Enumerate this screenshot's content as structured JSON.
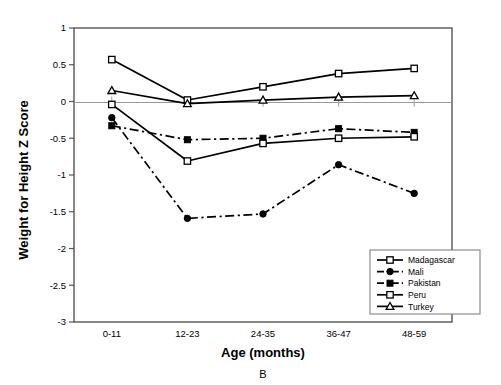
{
  "chart_data": {
    "type": "line",
    "title": "",
    "panel_letter": "B",
    "xlabel": "Age (months)",
    "ylabel": "Weight for Height Z Score",
    "categories": [
      "0-11",
      "12-23",
      "24-35",
      "36-47",
      "48-59"
    ],
    "ylim": [
      -3,
      1
    ],
    "yticks": [
      1,
      0.5,
      0,
      -0.5,
      -1,
      -1.5,
      -2,
      -2.5,
      -3
    ],
    "ytick_labels": [
      "1",
      "0.5",
      "0",
      "-0.5",
      "-1",
      "-1.5",
      "-2",
      "-2.5",
      "-3"
    ],
    "grid": false,
    "zero_line": true,
    "legend_position": "bottom-right",
    "series": [
      {
        "name": "Madagascar",
        "marker": "open-square",
        "line_style": "solid",
        "values": [
          0.57,
          0.02,
          0.2,
          0.38,
          0.45
        ]
      },
      {
        "name": "Mali",
        "marker": "filled-circle",
        "line_style": "dash-dot",
        "values": [
          -0.22,
          -1.59,
          -1.53,
          -0.86,
          -1.25
        ]
      },
      {
        "name": "Pakistan",
        "marker": "filled-square",
        "line_style": "dash-dot",
        "values": [
          -0.33,
          -0.52,
          -0.5,
          -0.37,
          -0.42
        ]
      },
      {
        "name": "Peru",
        "marker": "open-square",
        "line_style": "solid",
        "values": [
          -0.04,
          -0.81,
          -0.57,
          -0.5,
          -0.48
        ]
      },
      {
        "name": "Turkey",
        "marker": "open-triangle",
        "line_style": "solid",
        "values": [
          0.15,
          -0.03,
          0.02,
          0.06,
          0.08
        ]
      }
    ]
  },
  "colors": {
    "line": "#000000",
    "axis": "#555555",
    "zero_line": "#9a9a9a",
    "background": "#ffffff"
  }
}
